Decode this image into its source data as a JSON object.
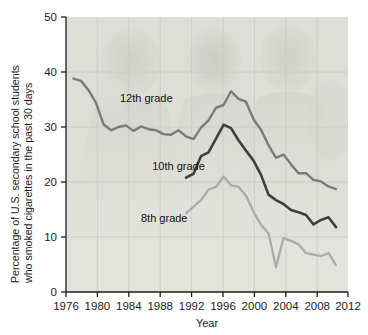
{
  "chart_data": {
    "type": "line",
    "title": "",
    "xlabel": "Year",
    "ylabel": "Percentage of U.S. secondary school students who smoked cigarettes in the past 30 days",
    "ylabel_line1": "Percentage of U.S. secondary school students",
    "ylabel_line2": "who smoked cigarettes in the past 30 days",
    "xlim": [
      1975,
      2012.6
    ],
    "ylim": [
      0,
      50
    ],
    "xticks": [
      1976,
      1980,
      1984,
      1988,
      1992,
      1996,
      2000,
      2004,
      2008,
      2012
    ],
    "xtick_labels": [
      "1976",
      "1980",
      "1984",
      "1988",
      "1992",
      "1996",
      "2000",
      "2004",
      "2008",
      "2012"
    ],
    "yticks": [
      0,
      10,
      20,
      30,
      40,
      50
    ],
    "ytick_labels": [
      "0",
      "10",
      "20",
      "30",
      "40",
      "50"
    ],
    "grid": true,
    "legend_position": "inline-annotations",
    "series": [
      {
        "name": "12th grade",
        "color": "#7a7a78",
        "label_x": 1982.2,
        "label_y": 34.6,
        "x": [
          1976,
          1977,
          1978,
          1979,
          1980,
          1981,
          1982,
          1983,
          1984,
          1985,
          1986,
          1987,
          1988,
          1989,
          1990,
          1991,
          1992,
          1993,
          1994,
          1995,
          1996,
          1997,
          1998,
          1999,
          2000,
          2001,
          2002,
          2003,
          2004,
          2005,
          2006,
          2007,
          2008,
          2009,
          2010,
          2011
        ],
        "values": [
          38.8,
          38.4,
          36.7,
          34.4,
          30.5,
          29.4,
          30.0,
          30.3,
          29.3,
          30.1,
          29.6,
          29.4,
          28.7,
          28.6,
          29.4,
          28.3,
          27.8,
          29.9,
          31.2,
          33.5,
          34.0,
          36.5,
          35.1,
          34.6,
          31.4,
          29.5,
          26.7,
          24.4,
          25.0,
          23.2,
          21.6,
          21.6,
          20.4,
          20.1,
          19.2,
          18.7
        ]
      },
      {
        "name": "10th grade",
        "color": "#3f3f3f",
        "label_x": 1986.5,
        "label_y": 22.2,
        "x": [
          1991,
          1992,
          1993,
          1994,
          1995,
          1996,
          1997,
          1998,
          1999,
          2000,
          2001,
          2002,
          2003,
          2004,
          2005,
          2006,
          2007,
          2008,
          2009,
          2010,
          2011
        ],
        "values": [
          20.8,
          21.5,
          24.7,
          25.4,
          27.9,
          30.4,
          29.8,
          27.6,
          25.7,
          23.9,
          21.3,
          17.7,
          16.7,
          16.0,
          14.9,
          14.5,
          14.0,
          12.3,
          13.1,
          13.6,
          11.8
        ]
      },
      {
        "name": "8th grade",
        "color": "#aaaaa6",
        "label_x": 1985.0,
        "label_y": 12.8,
        "x": [
          1991,
          1992,
          1993,
          1994,
          1995,
          1996,
          1997,
          1998,
          1999,
          2000,
          2001,
          2002,
          2003,
          2004,
          2005,
          2006,
          2007,
          2008,
          2009,
          2010,
          2011
        ],
        "values": [
          14.3,
          15.5,
          16.7,
          18.6,
          19.1,
          21.0,
          19.4,
          19.1,
          17.5,
          14.6,
          12.2,
          10.7,
          4.5,
          9.8,
          9.3,
          8.7,
          7.1,
          6.8,
          6.5,
          7.1,
          4.9
        ]
      }
    ]
  },
  "figure": {
    "background_color": "#ffffff",
    "plot_background_color": "#e3e3df",
    "grid_color": "#c9c9c4",
    "watermark": "faded photograph of school students behind plot area"
  }
}
